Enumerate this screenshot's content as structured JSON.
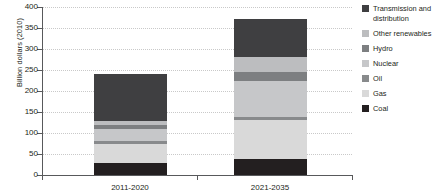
{
  "chart_data": {
    "type": "bar",
    "stacked": true,
    "title": "",
    "xlabel": "",
    "ylabel": "Billion dollars (2010)",
    "ylim": [
      0,
      400
    ],
    "yticks": [
      0,
      50,
      100,
      150,
      200,
      250,
      300,
      350,
      400
    ],
    "ytick_labels": [
      "0",
      "50",
      "100",
      "150",
      "200",
      "250",
      "300",
      "350",
      "400"
    ],
    "grid": true,
    "legend_position": "right",
    "categories": [
      "2011-2020",
      "2021-2035"
    ],
    "series": [
      {
        "name": "Coal",
        "color": "#231f20",
        "values": [
          28,
          38
        ]
      },
      {
        "name": "Gas",
        "color": "#d9d9d9",
        "values": [
          47,
          92
        ]
      },
      {
        "name": "Oil",
        "color": "#888a8c",
        "values": [
          7,
          8
        ]
      },
      {
        "name": "Nuclear",
        "color": "#c6c7c9",
        "values": [
          28,
          87
        ]
      },
      {
        "name": "Hydro",
        "color": "#7d7f81",
        "values": [
          8,
          20
        ]
      },
      {
        "name": "Other renewables",
        "color": "#bcbdbf",
        "values": [
          10,
          35
        ]
      },
      {
        "name": "Transmission and distribution",
        "color": "#3f3f41",
        "values": [
          112,
          92
        ]
      }
    ],
    "totals": [
      240,
      372
    ]
  },
  "axis": {
    "y_title": "Billion dollars (2010)",
    "labels": {
      "t400": "400",
      "t350": "350",
      "t300": "300",
      "t250": "250",
      "t200": "200",
      "t150": "150",
      "t100": "100",
      "t50": "50",
      "t0": "0"
    },
    "x_labels": {
      "cat0": "2011-2020",
      "cat1": "2021-2035"
    }
  },
  "legend": {
    "items": [
      {
        "label": "Transmission and distribution",
        "color": "#3f3f41"
      },
      {
        "label": "Other renewables",
        "color": "#bcbdbf"
      },
      {
        "label": "Hydro",
        "color": "#7d7f81"
      },
      {
        "label": "Nuclear",
        "color": "#c6c7c9"
      },
      {
        "label": "Oil",
        "color": "#888a8c"
      },
      {
        "label": "Gas",
        "color": "#d9d9d9"
      },
      {
        "label": "Coal",
        "color": "#231f20"
      }
    ]
  }
}
